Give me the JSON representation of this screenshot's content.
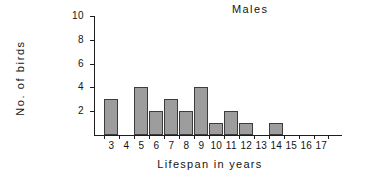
{
  "chart_data": {
    "type": "bar",
    "title": "Males",
    "xlabel": "Lifespan in years",
    "ylabel": "No. of birds",
    "categories": [
      "3",
      "4",
      "5",
      "6",
      "7",
      "8",
      "9",
      "10",
      "11",
      "12",
      "13",
      "14",
      "15",
      "16",
      "17"
    ],
    "values": [
      3,
      0,
      4,
      2,
      3,
      2,
      4,
      1,
      2,
      1,
      0,
      1,
      0,
      0,
      0
    ],
    "ylim": [
      0,
      10
    ],
    "yticks": [
      0,
      2,
      4,
      6,
      8,
      10
    ],
    "ytick_labels": [
      "",
      "2",
      "4",
      "6",
      "8",
      "10"
    ],
    "grid": false,
    "legend": false,
    "bar_color": "#9d9d9d",
    "bar_edge_color": "#3c3c3c",
    "axis_color": "#1d1d1d",
    "background": "#ffffff"
  }
}
